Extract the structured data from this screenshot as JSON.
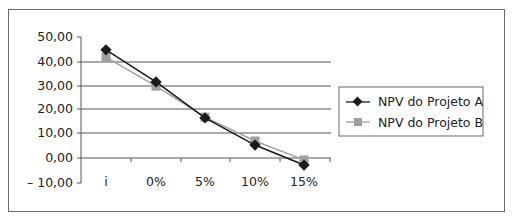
{
  "chart_data": {
    "type": "line",
    "title": "",
    "xlabel": "",
    "ylabel": "",
    "categories": [
      "i",
      "0%",
      "5%",
      "10%",
      "15%"
    ],
    "series": [
      {
        "name": "NPV do Projeto A",
        "values": [
          44.5,
          31.3,
          16.5,
          5.3,
          -2.9
        ],
        "color": "#1a1a1a",
        "marker": "diamond"
      },
      {
        "name": "NPV do Projeto B",
        "values": [
          41.5,
          29.6,
          16.8,
          7.0,
          -0.8
        ],
        "color": "#a0a0a0",
        "marker": "square"
      }
    ],
    "ylim": [
      -10,
      50
    ],
    "yticks": [
      "50,00",
      "40,00",
      "30,00",
      "20,00",
      "10,00",
      "0,00",
      "– 10,00"
    ],
    "ytick_values": [
      50,
      40,
      30,
      20,
      10,
      0,
      -10
    ],
    "grid": true,
    "legend_position": "right"
  },
  "legend": {
    "items": [
      {
        "label": "NPV do Projeto A"
      },
      {
        "label": "NPV do Projeto B"
      }
    ]
  },
  "axis": {
    "y_labels": [
      "50,00",
      "40,00",
      "30,00",
      "20,00",
      "10,00",
      "0,00",
      "– 10,00"
    ],
    "x_labels": [
      "i",
      "0%",
      "5%",
      "10%",
      "15%"
    ]
  }
}
